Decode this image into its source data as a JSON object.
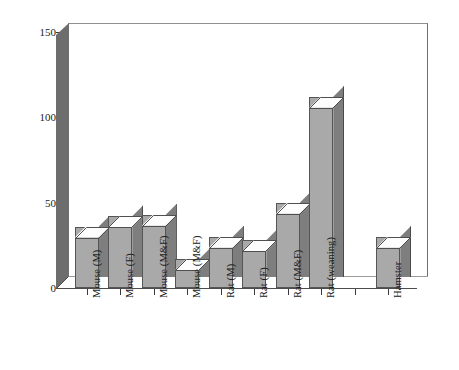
{
  "chart_data": {
    "type": "bar",
    "title": "",
    "xlabel": "",
    "ylabel": "mg/kg body weight",
    "ylim": [
      0,
      155
    ],
    "yticks": [
      0,
      50,
      100,
      150
    ],
    "ytick_labels": [
      "0",
      "50",
      "100",
      "150"
    ],
    "grid": false,
    "legend": false,
    "style": "3d-bars",
    "categories": [
      "Mouse (M)",
      "Mouse (F)",
      "Mouse (M&F)",
      "Mouse (M&F)",
      "Rat (M)",
      "Rat (F)",
      "Rat (M&F)",
      "Rat (weaning)",
      "",
      "Hamster"
    ],
    "values": [
      36,
      42,
      43,
      17,
      30,
      28,
      50,
      112,
      null,
      30
    ],
    "units": "mg/kg body weight"
  },
  "colors": {
    "bar_front": "#a9a9a9",
    "bar_side": "#7e7e7e",
    "bar_top": "#fdfdfd",
    "bar_outline": "#555555",
    "axis_wall": "#6d6d6d",
    "axis_line": "#3a3a3a",
    "background": "#ffffff",
    "text": "#1a1a1a"
  }
}
